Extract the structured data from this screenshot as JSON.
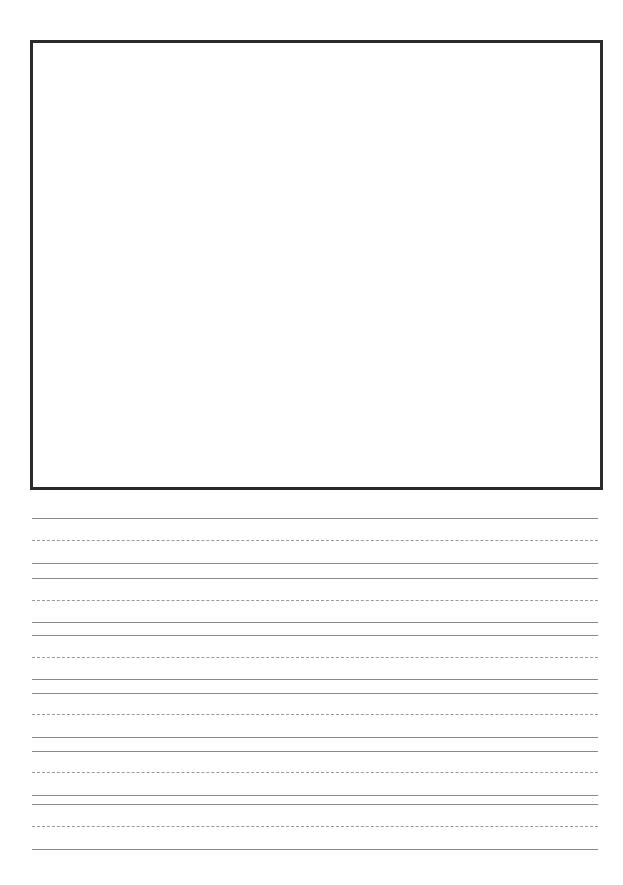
{
  "page": {
    "type": "handwriting-practice-sheet",
    "drawing_box": {
      "left": 30,
      "top": 40,
      "right": 600,
      "bottom": 487,
      "border_color": "#2b2b2b"
    },
    "lines": [
      {
        "y": 518,
        "style": "solid"
      },
      {
        "y": 540,
        "style": "dashed"
      },
      {
        "y": 563,
        "style": "solid"
      },
      {
        "y": 578,
        "style": "solid"
      },
      {
        "y": 600,
        "style": "dashed"
      },
      {
        "y": 622,
        "style": "solid"
      },
      {
        "y": 635,
        "style": "solid"
      },
      {
        "y": 657,
        "style": "dashed"
      },
      {
        "y": 679,
        "style": "solid"
      },
      {
        "y": 693,
        "style": "solid"
      },
      {
        "y": 714,
        "style": "dashed"
      },
      {
        "y": 737,
        "style": "solid"
      },
      {
        "y": 751,
        "style": "solid"
      },
      {
        "y": 772,
        "style": "dashed"
      },
      {
        "y": 795,
        "style": "solid"
      },
      {
        "y": 804,
        "style": "solid"
      },
      {
        "y": 826,
        "style": "dashed"
      },
      {
        "y": 849,
        "style": "solid"
      }
    ],
    "line_color": "#8a8a8a"
  }
}
